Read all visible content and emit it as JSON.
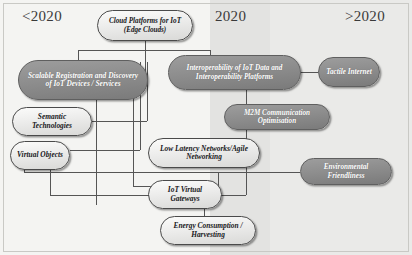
{
  "diagram": {
    "eras": [
      {
        "id": "past",
        "label": "<2020"
      },
      {
        "id": "now",
        "label": "2020"
      },
      {
        "id": "future",
        "label": ">2020"
      }
    ],
    "colors": {
      "dark_node_fill": "#8c8c8c",
      "dark_node_text": "#ffffff",
      "light_node_fill": "#ececeb",
      "light_node_text": "#17171a",
      "connector": "#555555",
      "band_past": "#f4f4f2",
      "band_now": "#e3e3e1",
      "band_future": "#eaeae8"
    },
    "nodes": [
      {
        "id": "cloud-platforms",
        "label": "Cloud Platforms for IoT (Edge Clouds)",
        "style": "light"
      },
      {
        "id": "scalable-registration",
        "label": "Scalable Registration and Discovery of IoT Devices / Services",
        "style": "dark"
      },
      {
        "id": "interoperability",
        "label": "Interoperability of IoT Data and Interoperability Platforms",
        "style": "dark"
      },
      {
        "id": "tactile-internet",
        "label": "Tactile Internet",
        "style": "dark"
      },
      {
        "id": "semantic-technologies",
        "label": "Semantic Technologies",
        "style": "light"
      },
      {
        "id": "m2m-communication",
        "label": "M2M Communication Optimisation",
        "style": "dark"
      },
      {
        "id": "virtual-objects",
        "label": "Virtual Objects",
        "style": "light"
      },
      {
        "id": "low-latency-networks",
        "label": "Low Latency Networks/Agile Networking",
        "style": "light"
      },
      {
        "id": "environmental-friendliness",
        "label": "Environmental Friendliness",
        "style": "dark"
      },
      {
        "id": "iot-virtual-gateways",
        "label": "IoT Virtual Gateways",
        "style": "light"
      },
      {
        "id": "energy-consumption",
        "label": "Energy Consumption / Harvesting",
        "style": "light"
      }
    ]
  }
}
